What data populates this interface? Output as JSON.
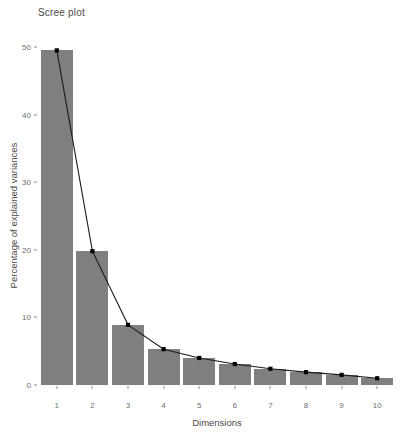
{
  "chart_data": {
    "type": "bar",
    "title": "Scree plot",
    "xlabel": "Dimensions",
    "ylabel": "Percentage of explained variances",
    "categories": [
      "1",
      "2",
      "3",
      "4",
      "5",
      "6",
      "7",
      "8",
      "9",
      "10"
    ],
    "values": [
      49.5,
      19.8,
      8.9,
      5.3,
      4.0,
      3.1,
      2.4,
      1.9,
      1.5,
      1.0
    ],
    "series": [
      {
        "name": "Percentage of explained variances",
        "values": [
          49.5,
          19.8,
          8.9,
          5.3,
          4.0,
          3.1,
          2.4,
          1.9,
          1.5,
          1.0
        ]
      }
    ],
    "overlay": {
      "type": "line",
      "marker": "square",
      "marker_color": "#000000",
      "line_color": "#1a1a1a",
      "values": [
        49.5,
        19.8,
        8.9,
        5.3,
        4.0,
        3.1,
        2.4,
        1.9,
        1.5,
        1.0
      ]
    },
    "ylim": [
      0,
      50
    ],
    "yticks": [
      0,
      10,
      20,
      30,
      40,
      50
    ],
    "ytick_labels": [
      "0",
      "10",
      "20",
      "30",
      "40",
      "50"
    ],
    "xticks": [
      "1",
      "2",
      "3",
      "4",
      "5",
      "6",
      "7",
      "8",
      "9",
      "10"
    ],
    "grid": false,
    "legend": null,
    "bar_color": "#7f7f7f",
    "background": "#ffffff"
  },
  "colors": {
    "bar_fill": "#7f7f7f",
    "line": "#1a1a1a",
    "marker": "#000000",
    "axis_text": "#6e6e6e",
    "title_text": "#4a4a4a",
    "background": "#ffffff"
  }
}
